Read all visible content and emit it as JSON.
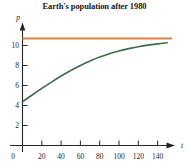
{
  "chart_data": {
    "type": "line",
    "title": "Earth's population after 1980",
    "xlabel": "t",
    "ylabel": "p",
    "xlim": [
      0,
      155
    ],
    "ylim": [
      0,
      11.9
    ],
    "grid": false,
    "legend": "none",
    "xticks": [
      0,
      20,
      40,
      60,
      80,
      100,
      120,
      140
    ],
    "yticks": [
      0,
      2,
      4,
      6,
      8,
      10
    ],
    "xtick_labels": [
      "0",
      "20",
      "40",
      "60",
      "80",
      "100",
      "120",
      "140"
    ],
    "ytick_labels": [
      "0",
      "2",
      "4",
      "6",
      "8",
      "10"
    ],
    "series": [
      {
        "name": "carrying-capacity-asymptote",
        "type": "line",
        "color": "#dd8040",
        "style": "solid",
        "x": [
          0,
          155
        ],
        "values": [
          11.0,
          11.0
        ]
      },
      {
        "name": "population-logistic-curve",
        "type": "line",
        "color": "#3f6b4d",
        "style": "solid",
        "x": [
          0,
          10,
          20,
          30,
          40,
          50,
          60,
          70,
          80,
          90,
          100,
          110,
          120,
          130,
          140,
          150
        ],
        "values": [
          4.5,
          5.19,
          5.87,
          6.52,
          7.14,
          7.71,
          8.23,
          8.69,
          9.09,
          9.43,
          9.72,
          9.96,
          10.16,
          10.32,
          10.45,
          10.56
        ]
      }
    ]
  },
  "axes": {
    "y_axis_name": "p",
    "x_axis_name": "t",
    "origin_label": "0"
  },
  "colors": {
    "asymptote": "#dd8040",
    "curve": "#3f6b4d",
    "axis": "#25252a",
    "background": "#ffffff"
  }
}
